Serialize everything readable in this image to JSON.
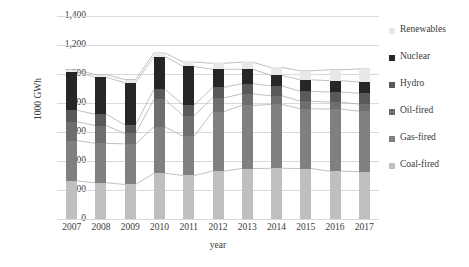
{
  "chart_data": {
    "type": "bar",
    "subtype": "stacked-column",
    "title": "",
    "xlabel": "year",
    "ylabel": "1000 GWh",
    "categories": [
      "2007",
      "2008",
      "2009",
      "2010",
      "2011",
      "2012",
      "2013",
      "2014",
      "2015",
      "2016",
      "2017"
    ],
    "ylim": [
      0,
      1400
    ],
    "ytick_values": [
      0,
      200,
      400,
      600,
      800,
      1000,
      1200,
      1400
    ],
    "ytick_labels": [
      "0",
      "200",
      "400",
      "600",
      "800",
      "1,000",
      "1,200",
      "1,400"
    ],
    "grid": true,
    "legend_position": "right",
    "stack_order_bottom_to_top": [
      "Coal-fired",
      "Gas-fired",
      "Oil-fired",
      "Hydro",
      "Nuclear",
      "Renewables"
    ],
    "connector_lines": true,
    "series": [
      {
        "name": "Coal-fired",
        "color": "#bfbfbf",
        "values": [
          262,
          250,
          238,
          315,
          300,
          330,
          348,
          350,
          348,
          330,
          326
        ]
      },
      {
        "name": "Gas-fired",
        "color": "#808080",
        "values": [
          278,
          272,
          280,
          320,
          270,
          410,
          435,
          440,
          412,
          428,
          418
        ]
      },
      {
        "name": "Oil-fired",
        "color": "#6e6e6e",
        "values": [
          130,
          122,
          72,
          190,
          142,
          95,
          80,
          60,
          52,
          48,
          48
        ]
      },
      {
        "name": "Hydro",
        "color": "#595959",
        "values": [
          80,
          78,
          60,
          70,
          75,
          72,
          70,
          68,
          68,
          70,
          75
        ]
      },
      {
        "name": "Nuclear",
        "color": "#262626",
        "values": [
          265,
          255,
          290,
          225,
          265,
          125,
          100,
          72,
          80,
          78,
          78
        ]
      },
      {
        "name": "Renewables",
        "color": "#e8e8e8",
        "values": [
          15,
          18,
          22,
          25,
          30,
          42,
          48,
          55,
          62,
          75,
          90
        ]
      }
    ],
    "totals": [
      1030,
      995,
      962,
      1145,
      1082,
      1074,
      1081,
      1045,
      1022,
      1029,
      1035
    ]
  },
  "legend": {
    "items": [
      {
        "label": "Renewables",
        "color": "#e8e8e8"
      },
      {
        "label": "Nuclear",
        "color": "#262626"
      },
      {
        "label": "Hydro",
        "color": "#595959"
      },
      {
        "label": "Oil-fired",
        "color": "#6e6e6e"
      },
      {
        "label": "Gas-fired",
        "color": "#808080"
      },
      {
        "label": "Coal-fired",
        "color": "#bfbfbf"
      }
    ]
  }
}
